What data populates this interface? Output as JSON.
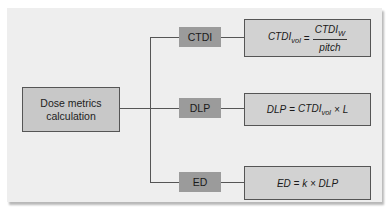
{
  "diagram": {
    "root": {
      "line1": "Dose metrics",
      "line2": "calculation"
    },
    "branches": [
      {
        "label": "CTDI",
        "formula": {
          "lhs": "CTDI",
          "lhs_sub": "vol",
          "eq": "=",
          "num": "CTDI",
          "num_sub": "W",
          "den": "pitch"
        }
      },
      {
        "label": "DLP",
        "formula": {
          "lhs": "DLP",
          "eq": "=",
          "term": "CTDI",
          "term_sub": "vol",
          "rest": "× L"
        }
      },
      {
        "label": "ED",
        "formula": {
          "text": "ED = k × DLP"
        }
      }
    ],
    "colors": {
      "panel": "#eeeeee",
      "root_box": "#c8c8c8",
      "branch_box": "#9b9b9b",
      "formula_box": "#d2d2d2",
      "line": "#555555"
    }
  }
}
